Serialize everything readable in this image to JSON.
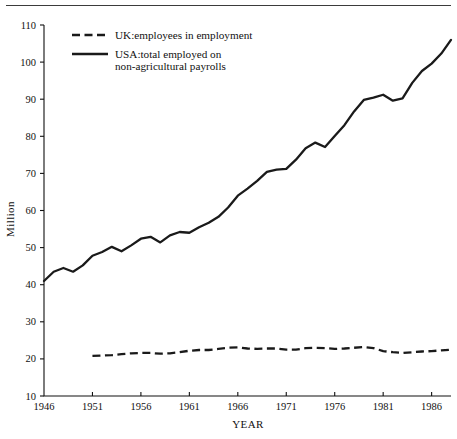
{
  "chart_data": {
    "type": "line",
    "title": "",
    "xlabel": "YEAR",
    "ylabel": "Million",
    "xlim": [
      1946,
      1988
    ],
    "ylim": [
      10,
      110
    ],
    "grid": false,
    "legend_position": "top-left-inside",
    "xticks": [
      1946,
      1951,
      1956,
      1961,
      1966,
      1971,
      1976,
      1981,
      1986
    ],
    "xtick_labels": [
      "1946",
      "1951",
      "1956",
      "1961",
      "1966",
      "1971",
      "1976",
      "1981",
      "1986"
    ],
    "yticks": [
      10,
      20,
      30,
      40,
      50,
      60,
      70,
      80,
      90,
      100,
      110
    ],
    "ytick_labels": [
      "10",
      "20",
      "30",
      "40",
      "50",
      "60",
      "70",
      "80",
      "90",
      "100",
      "110"
    ],
    "series": [
      {
        "name": "UK:employees in employment",
        "style": "dashed",
        "x": [
          1951,
          1952,
          1953,
          1954,
          1955,
          1956,
          1957,
          1958,
          1959,
          1960,
          1961,
          1962,
          1963,
          1964,
          1965,
          1966,
          1967,
          1968,
          1969,
          1970,
          1971,
          1972,
          1973,
          1974,
          1975,
          1976,
          1977,
          1978,
          1979,
          1980,
          1981,
          1982,
          1983,
          1984,
          1985,
          1986,
          1987,
          1988
        ],
        "values": [
          20.8,
          20.9,
          21.0,
          21.3,
          21.5,
          21.6,
          21.6,
          21.4,
          21.5,
          21.8,
          22.2,
          22.4,
          22.4,
          22.7,
          23.0,
          23.1,
          22.8,
          22.7,
          22.8,
          22.8,
          22.5,
          22.5,
          22.9,
          23.0,
          22.9,
          22.7,
          22.8,
          23.0,
          23.2,
          22.9,
          22.1,
          21.8,
          21.6,
          21.8,
          22.0,
          22.1,
          22.3,
          22.5
        ]
      },
      {
        "name": "USA:total employed on non-agricultural payrolls",
        "style": "solid",
        "x": [
          1946,
          1947,
          1948,
          1949,
          1950,
          1951,
          1952,
          1953,
          1954,
          1955,
          1956,
          1957,
          1958,
          1959,
          1960,
          1961,
          1962,
          1963,
          1964,
          1965,
          1966,
          1967,
          1968,
          1969,
          1970,
          1971,
          1972,
          1973,
          1974,
          1975,
          1976,
          1977,
          1978,
          1979,
          1980,
          1981,
          1982,
          1983,
          1984,
          1985,
          1986,
          1987,
          1988
        ],
        "values": [
          41.0,
          43.5,
          44.5,
          43.5,
          45.2,
          47.8,
          48.8,
          50.2,
          49.0,
          50.6,
          52.4,
          52.9,
          51.4,
          53.3,
          54.2,
          54.0,
          55.5,
          56.7,
          58.3,
          60.8,
          64.0,
          65.9,
          68.0,
          70.4,
          71.0,
          71.2,
          73.7,
          76.8,
          78.3,
          77.1,
          80.1,
          83.0,
          86.7,
          89.8,
          90.4,
          91.2,
          89.6,
          90.2,
          94.4,
          97.6,
          99.6,
          102.3,
          106.0
        ]
      }
    ],
    "legend": [
      {
        "label": "UK:employees in employment",
        "style": "dashed",
        "line2": ""
      },
      {
        "label": "USA:total employed on",
        "style": "solid",
        "line2": "non-agricultural payrolls"
      }
    ]
  }
}
